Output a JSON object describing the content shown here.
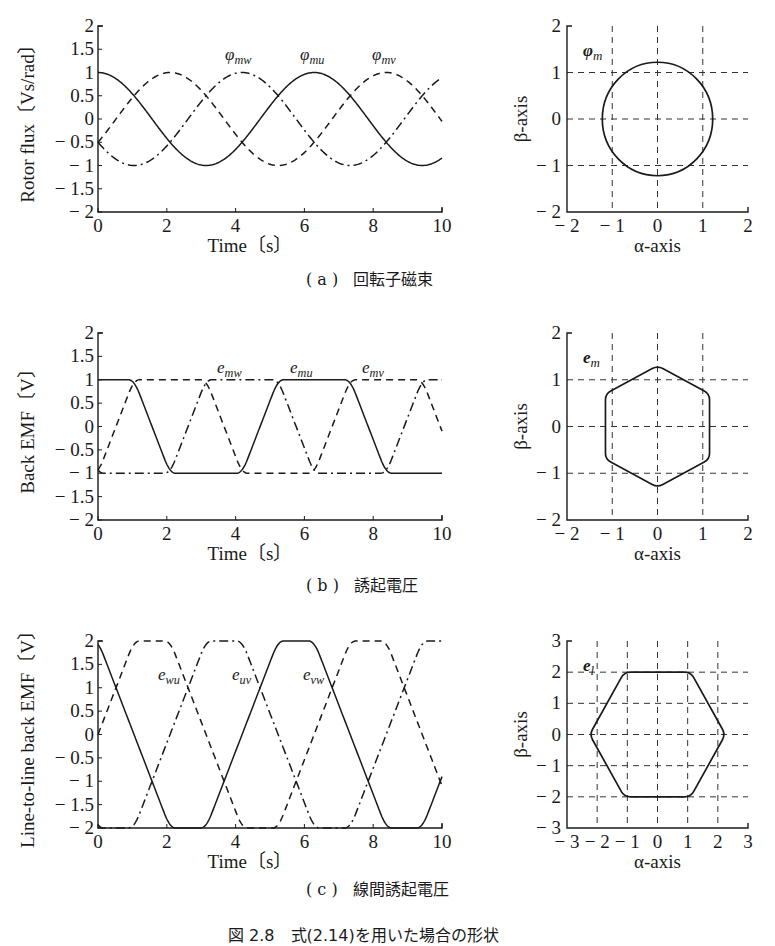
{
  "figure_caption": "図 2.8　式(2.14)を用いた場合の形状",
  "panels": [
    {
      "id": "a",
      "caption_letter": "( a )",
      "caption_text": "回転子磁束",
      "time_plot": {
        "ylabel": "Rotor flux〔Vs/rad〕",
        "xlabel": "Time〔s〕",
        "yticks": [
          "2",
          "1.5",
          "1",
          "0.5",
          "0",
          "− 0.5",
          "− 1",
          "− 1.5",
          "− 2"
        ],
        "xticks": [
          "0",
          "2",
          "4",
          "6",
          "8",
          "10"
        ],
        "labels": [
          "φmw",
          "φmu",
          "φmv"
        ]
      },
      "vector_plot": {
        "ylabel": "β-axis",
        "xlabel": "α-axis",
        "label": "φm",
        "xticks": [
          "− 2",
          "− 1",
          "0",
          "1",
          "2"
        ],
        "yticks": [
          "2",
          "1",
          "0",
          "− 1",
          "− 2"
        ]
      }
    },
    {
      "id": "b",
      "caption_letter": "( b )",
      "caption_text": "誘起電圧",
      "time_plot": {
        "ylabel": "Back EMF〔V〕",
        "xlabel": "Time〔s〕",
        "yticks": [
          "2",
          "1.5",
          "1",
          "0.5",
          "0",
          "− 0.5",
          "− 1",
          "− 1.5",
          "− 2"
        ],
        "xticks": [
          "0",
          "2",
          "4",
          "6",
          "8",
          "10"
        ],
        "labels": [
          "emw",
          "emu",
          "emv"
        ]
      },
      "vector_plot": {
        "ylabel": "β-axis",
        "xlabel": "α-axis",
        "label": "em",
        "xticks": [
          "− 2",
          "− 1",
          "0",
          "1",
          "2"
        ],
        "yticks": [
          "2",
          "1",
          "0",
          "− 1",
          "− 2"
        ]
      }
    },
    {
      "id": "c",
      "caption_letter": "( c )",
      "caption_text": "線間誘起電圧",
      "time_plot": {
        "ylabel": "Line-to-line back EMF〔V〕",
        "xlabel": "Time〔s〕",
        "yticks": [
          "2",
          "1.5",
          "1",
          "0.5",
          "0",
          "− 0.5",
          "− 1",
          "− 1.5",
          "− 2"
        ],
        "xticks": [
          "0",
          "2",
          "4",
          "6",
          "8",
          "10"
        ],
        "labels": [
          "ewu",
          "euv",
          "evw"
        ]
      },
      "vector_plot": {
        "ylabel": "β-axis",
        "xlabel": "α-axis",
        "label": "el",
        "xticks": [
          "− 3",
          "− 2",
          "− 1",
          "0",
          "1",
          "2",
          "3"
        ],
        "yticks": [
          "3",
          "2",
          "1",
          "0",
          "− 1",
          "− 2",
          "− 3"
        ]
      }
    }
  ],
  "chart_data": [
    {
      "type": "line",
      "title": "(a) 回転子磁束 — Rotor flux vs time",
      "xlabel": "Time〔s〕",
      "ylabel": "Rotor flux〔Vs/rad〕",
      "xlim": [
        0,
        10
      ],
      "ylim": [
        -2,
        2
      ],
      "grid": false,
      "x": [
        0,
        1,
        2,
        3,
        4,
        5,
        6,
        7,
        8,
        9,
        10
      ],
      "series": [
        {
          "name": "φmu",
          "style": "solid",
          "values": [
            1.0,
            0.54,
            -0.42,
            -0.99,
            -0.65,
            0.28,
            0.96,
            0.75,
            -0.15,
            -0.91,
            -0.84
          ]
        },
        {
          "name": "φmv",
          "style": "dashed",
          "values": [
            -0.5,
            0.44,
            0.98,
            0.72,
            -0.2,
            -0.93,
            -0.81,
            0.02,
            0.87,
            0.89,
            0.11
          ]
        },
        {
          "name": "φmw",
          "style": "dashdot",
          "values": [
            -0.5,
            -0.98,
            -0.56,
            0.27,
            0.85,
            0.65,
            -0.15,
            -0.77,
            -0.72,
            0.02,
            0.73
          ]
        }
      ],
      "period": 6.283,
      "amplitude": 1.0
    },
    {
      "type": "scatter",
      "title": "(a) φm trajectory in α-β plane",
      "xlabel": "α-axis",
      "ylabel": "β-axis",
      "xlim": [
        -2,
        2
      ],
      "ylim": [
        -2,
        2
      ],
      "grid": true,
      "shape": "circle",
      "radius": 1.22
    },
    {
      "type": "line",
      "title": "(b) 誘起電圧 — Back EMF vs time",
      "xlabel": "Time〔s〕",
      "ylabel": "Back EMF〔V〕",
      "xlim": [
        0,
        10
      ],
      "ylim": [
        -2,
        2
      ],
      "grid": false,
      "x": [
        0,
        1,
        2,
        3,
        4,
        5,
        6,
        7,
        8,
        9,
        10
      ],
      "series": [
        {
          "name": "emu",
          "style": "solid",
          "values": [
            0.0,
            -0.95,
            -1.0,
            0.0,
            0.9,
            1.0,
            0.35,
            -0.6,
            -1.0,
            -0.55,
            0.5
          ]
        },
        {
          "name": "emv",
          "style": "dashed",
          "values": [
            1.0,
            1.0,
            0.05,
            -0.95,
            -1.0,
            -0.1,
            0.9,
            1.0,
            0.2,
            -0.75,
            -1.0
          ]
        },
        {
          "name": "emw",
          "style": "dashdot",
          "values": [
            -1.0,
            -0.05,
            0.95,
            1.0,
            0.1,
            -0.9,
            -1.0,
            -0.25,
            0.8,
            1.0,
            0.5
          ]
        }
      ],
      "waveform": "trapezoidal",
      "period": 6.283,
      "amplitude": 1.0
    },
    {
      "type": "scatter",
      "title": "(b) em trajectory in α-β plane",
      "xlabel": "α-axis",
      "ylabel": "β-axis",
      "xlim": [
        -2,
        2
      ],
      "ylim": [
        -2,
        2
      ],
      "grid": true,
      "shape": "hexagon (pointy-top, rounded)",
      "vertices": [
        [
          0,
          1.3
        ],
        [
          1.15,
          0.7
        ],
        [
          1.15,
          -0.7
        ],
        [
          0,
          -1.3
        ],
        [
          -1.15,
          -0.7
        ],
        [
          -1.15,
          0.7
        ]
      ]
    },
    {
      "type": "line",
      "title": "(c) 線間誘起電圧 — Line-to-line back EMF vs time",
      "xlabel": "Time〔s〕",
      "ylabel": "Line-to-line back EMF〔V〕",
      "xlim": [
        0,
        10
      ],
      "ylim": [
        -2,
        2
      ],
      "grid": false,
      "x": [
        0,
        1,
        2,
        3,
        4,
        5,
        6,
        7,
        8,
        9,
        10
      ],
      "series": [
        {
          "name": "euv",
          "style": "solid",
          "values": [
            -1.0,
            -1.9,
            -1.1,
            0.9,
            1.85,
            1.1,
            -0.55,
            -1.6,
            -1.2,
            0.2,
            1.5
          ]
        },
        {
          "name": "evw",
          "style": "dashed",
          "values": [
            2.0,
            1.05,
            -1.0,
            -1.95,
            -1.1,
            0.8,
            1.9,
            1.25,
            -0.6,
            -1.75,
            -1.5
          ]
        },
        {
          "name": "ewu",
          "style": "dashdot",
          "values": [
            -1.0,
            0.9,
            2.0,
            1.0,
            -0.8,
            -1.9,
            -1.35,
            0.35,
            1.8,
            1.55,
            0.0
          ]
        }
      ],
      "period": 6.283,
      "amplitude": 1.85
    },
    {
      "type": "scatter",
      "title": "(c) el trajectory in α-β plane",
      "xlabel": "α-axis",
      "ylabel": "β-axis",
      "xlim": [
        -3,
        3
      ],
      "ylim": [
        -3,
        3
      ],
      "grid": true,
      "shape": "hexagon (flat-top, rounded)",
      "vertices": [
        [
          1.1,
          2.0
        ],
        [
          2.25,
          0
        ],
        [
          1.1,
          -2.0
        ],
        [
          -1.1,
          -2.0
        ],
        [
          -2.25,
          0
        ],
        [
          -1.1,
          2.0
        ]
      ]
    }
  ]
}
